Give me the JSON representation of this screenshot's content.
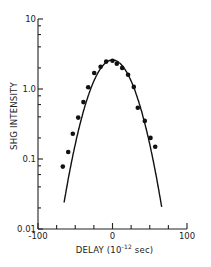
{
  "chart_data": {
    "type": "scatter",
    "title": "",
    "xlabel": "DELAY (10^-12 sec)",
    "xlabel_parts": {
      "prefix": "DELAY (10",
      "sup": "-12",
      "suffix": " sec)"
    },
    "ylabel": "SHG INTENSITY",
    "xlim": [
      -100,
      100
    ],
    "ylim": [
      0.01,
      10
    ],
    "yscale": "log",
    "grid": false,
    "legend": null,
    "x_ticks": [
      -100,
      0,
      100
    ],
    "x_tick_labels": [
      "-100",
      "0",
      "100"
    ],
    "x_minor_ticks": [
      -75,
      -50,
      -25,
      25,
      50,
      75
    ],
    "y_ticks": [
      10,
      1.0,
      0.1,
      0.01
    ],
    "y_tick_labels": [
      "10",
      "1.0",
      "0.1",
      "0.01"
    ],
    "series": [
      {
        "name": "measured",
        "kind": "points",
        "x": [
          -66.7,
          -59.5,
          -53.3,
          -46,
          -39,
          -32.6,
          -24.6,
          -16,
          -8.5,
          0,
          5.8,
          13,
          21,
          28.6,
          34,
          43.4,
          51,
          57.3
        ],
        "y": [
          0.078,
          0.126,
          0.23,
          0.39,
          0.65,
          1.06,
          1.69,
          2.08,
          2.46,
          2.54,
          2.3,
          2.0,
          1.6,
          1.07,
          0.54,
          0.35,
          0.2,
          0.15
        ]
      },
      {
        "name": "gaussian fit",
        "kind": "line",
        "peak": 2.6,
        "log_curvature": 0.000482,
        "x_range": [
          -65,
          66
        ]
      }
    ]
  }
}
